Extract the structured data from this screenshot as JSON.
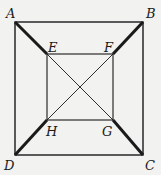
{
  "diagram": {
    "colors": {
      "background": "#f2f2f0",
      "stroke": "#1a1a1a"
    },
    "points": {
      "A": {
        "label": "A",
        "x": 15,
        "y": 22
      },
      "B": {
        "label": "B",
        "x": 143,
        "y": 22
      },
      "C": {
        "label": "C",
        "x": 143,
        "y": 155
      },
      "D": {
        "label": "D",
        "x": 15,
        "y": 155
      },
      "E": {
        "label": "E",
        "x": 47,
        "y": 54
      },
      "F": {
        "label": "F",
        "x": 113,
        "y": 54
      },
      "G": {
        "label": "G",
        "x": 113,
        "y": 120
      },
      "H": {
        "label": "H",
        "x": 47,
        "y": 120
      }
    },
    "segments": {
      "outer_square": [
        "AB",
        "BC",
        "CD",
        "DA"
      ],
      "inner_square": [
        "EF",
        "FG",
        "GH",
        "HE"
      ],
      "thick_connectors": [
        "AE",
        "BF",
        "CG",
        "DH"
      ],
      "thin_diagonals": [
        "EG",
        "FH"
      ]
    }
  }
}
